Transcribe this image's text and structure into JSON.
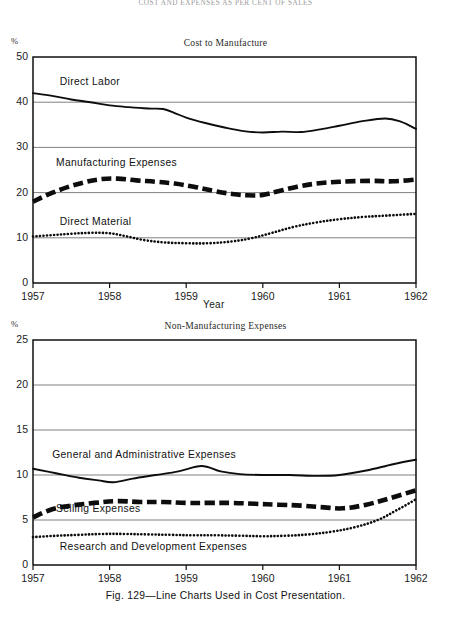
{
  "running_header": "COST AND EXPENSES AS PER CENT OF SALES",
  "caption": "Fig. 129—Line Charts Used in Cost Presentation.",
  "axis": {
    "percent_symbol": "%",
    "x_axis_name": "Year"
  },
  "chart_data": [
    {
      "type": "line",
      "title": "Cost to Manufacture",
      "xlabel": "Year",
      "ylabel": "%",
      "ylim": [
        0,
        50
      ],
      "xlim": [
        1957,
        1962
      ],
      "yticks": [
        0,
        10,
        20,
        30,
        40,
        50
      ],
      "xticks": [
        "1957",
        "1958",
        "1959",
        "1960",
        "1961",
        "1962"
      ],
      "grid": true,
      "legend_position": "inline-labels",
      "series": [
        {
          "name": "Direct Labor",
          "style": "solid",
          "label_x": 1957.35,
          "label_y": 44.2,
          "x": [
            1957.0,
            1957.25,
            1957.5,
            1957.75,
            1958.0,
            1958.25,
            1958.5,
            1958.7,
            1958.85,
            1959.0,
            1959.25,
            1959.5,
            1959.75,
            1960.0,
            1960.25,
            1960.5,
            1960.75,
            1961.0,
            1961.3,
            1961.6,
            1961.8,
            1962.0
          ],
          "values": [
            42.0,
            41.4,
            40.6,
            40.0,
            39.3,
            38.9,
            38.6,
            38.5,
            37.6,
            36.6,
            35.4,
            34.4,
            33.6,
            33.3,
            33.5,
            33.4,
            34.0,
            34.8,
            35.8,
            36.4,
            35.7,
            34.1
          ]
        },
        {
          "name": "Manufacturing Expenses",
          "style": "heavy-dashed",
          "label_x": 1957.3,
          "label_y": 26.3,
          "x": [
            1957.0,
            1957.2,
            1957.45,
            1957.7,
            1957.9,
            1958.1,
            1958.35,
            1958.6,
            1958.85,
            1959.1,
            1959.35,
            1959.6,
            1959.8,
            1960.0,
            1960.2,
            1960.45,
            1960.7,
            1961.0,
            1961.4,
            1961.7,
            1962.0
          ],
          "values": [
            18.0,
            19.6,
            21.2,
            22.4,
            23.0,
            23.1,
            22.7,
            22.4,
            22.0,
            21.3,
            20.4,
            19.7,
            19.4,
            19.5,
            20.3,
            21.3,
            22.0,
            22.4,
            22.6,
            22.5,
            22.9
          ]
        },
        {
          "name": "Direct Material",
          "style": "dotted",
          "label_x": 1957.35,
          "label_y": 13.3,
          "x": [
            1957.0,
            1957.25,
            1957.5,
            1957.75,
            1958.0,
            1958.2,
            1958.45,
            1958.7,
            1959.0,
            1959.3,
            1959.6,
            1959.85,
            1960.1,
            1960.4,
            1960.7,
            1961.0,
            1961.3,
            1961.6,
            1962.0
          ],
          "values": [
            10.3,
            10.6,
            10.9,
            11.1,
            11.0,
            10.4,
            9.5,
            9.0,
            8.8,
            8.8,
            9.2,
            9.9,
            11.0,
            12.4,
            13.4,
            14.1,
            14.6,
            14.9,
            15.3
          ]
        }
      ]
    },
    {
      "type": "line",
      "title": "Non-Manufacturing Expenses",
      "xlabel": "",
      "ylabel": "%",
      "ylim": [
        0,
        25
      ],
      "xlim": [
        1957,
        1962
      ],
      "yticks": [
        0,
        5,
        10,
        15,
        20,
        25
      ],
      "xticks": [
        "1957",
        "1958",
        "1959",
        "1960",
        "1961",
        "1962"
      ],
      "grid": true,
      "legend_position": "inline-labels",
      "series": [
        {
          "name": "General and Administrative Expenses",
          "style": "solid",
          "label_x": 1957.25,
          "label_y": 12.1,
          "x": [
            1957.0,
            1957.3,
            1957.6,
            1957.85,
            1958.05,
            1958.3,
            1958.6,
            1958.9,
            1959.2,
            1959.45,
            1959.7,
            1960.0,
            1960.35,
            1960.7,
            1961.0,
            1961.35,
            1961.7,
            1962.0
          ],
          "values": [
            10.7,
            10.2,
            9.7,
            9.4,
            9.2,
            9.6,
            10.0,
            10.4,
            11.0,
            10.4,
            10.1,
            10.0,
            10.0,
            9.9,
            10.0,
            10.5,
            11.2,
            11.7
          ]
        },
        {
          "name": "Selling Expenses",
          "style": "heavy-dashed",
          "label_x": 1957.3,
          "label_y": 6.1,
          "x": [
            1957.0,
            1957.25,
            1957.5,
            1957.8,
            1958.1,
            1958.4,
            1958.7,
            1959.0,
            1959.3,
            1959.6,
            1959.9,
            1960.2,
            1960.5,
            1960.8,
            1961.05,
            1961.35,
            1961.65,
            1962.0
          ],
          "values": [
            5.3,
            6.2,
            6.6,
            6.9,
            7.1,
            7.0,
            7.0,
            6.9,
            6.9,
            6.9,
            6.8,
            6.7,
            6.6,
            6.4,
            6.3,
            6.7,
            7.4,
            8.3
          ]
        },
        {
          "name": "Research and Development Expenses",
          "style": "dotted",
          "label_x": 1957.35,
          "label_y": 1.9,
          "x": [
            1957.0,
            1957.3,
            1957.6,
            1957.9,
            1958.2,
            1958.5,
            1958.8,
            1959.1,
            1959.4,
            1959.7,
            1960.0,
            1960.3,
            1960.6,
            1960.9,
            1961.2,
            1961.5,
            1961.75,
            1962.0
          ],
          "values": [
            3.1,
            3.25,
            3.35,
            3.45,
            3.45,
            3.4,
            3.35,
            3.3,
            3.3,
            3.25,
            3.2,
            3.25,
            3.4,
            3.7,
            4.2,
            5.0,
            6.1,
            7.3
          ]
        }
      ]
    }
  ]
}
